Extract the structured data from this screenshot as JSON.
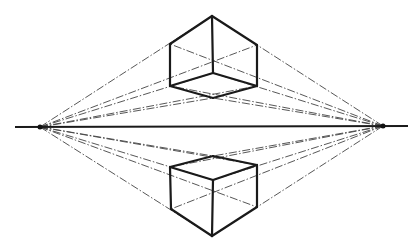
{
  "diagram": {
    "colors": {
      "ink": "#1a1a1a",
      "guide": "#444444",
      "background": "#ffffff"
    },
    "horizon": {
      "x1": 15,
      "y1": 127,
      "x2": 408,
      "y2": 126
    },
    "vanishing_points": [
      {
        "name": "left-vp",
        "x": 40,
        "y": 127
      },
      {
        "name": "right-vp",
        "x": 383,
        "y": 126
      }
    ],
    "cube_above": {
      "label": "cube-above-horizon",
      "vertices": {
        "top": [
          212,
          16
        ],
        "left_top": [
          170,
          44
        ],
        "right_top": [
          257,
          45
        ],
        "inner": [
          213,
          73
        ],
        "left_bottom": [
          170,
          86
        ],
        "right_bottom": [
          257,
          86
        ],
        "front_bottom": [
          213,
          98
        ]
      }
    },
    "cube_below": {
      "label": "cube-below-horizon",
      "vertices": {
        "back_top": [
          213,
          156
        ],
        "left_top": [
          170,
          167
        ],
        "right_top": [
          257,
          165
        ],
        "front_top": [
          213,
          180
        ],
        "left_bottom": [
          171,
          209
        ],
        "right_bottom": [
          257,
          207
        ],
        "front_bottom": [
          212,
          236
        ]
      }
    }
  }
}
